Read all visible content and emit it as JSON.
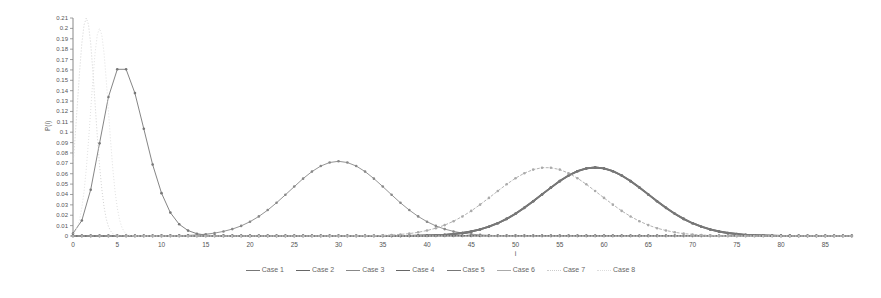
{
  "chart_data": {
    "type": "line",
    "title": "",
    "xlabel": "i",
    "ylabel": "P(i)",
    "xlim": [
      0,
      88
    ],
    "ylim": [
      0,
      0.21
    ],
    "x_ticks": [
      0,
      5,
      10,
      15,
      20,
      25,
      30,
      35,
      40,
      45,
      50,
      55,
      60,
      65,
      70,
      75,
      80,
      85
    ],
    "y_ticks": [
      0,
      0.01,
      0.02,
      0.03,
      0.04,
      0.05,
      0.06,
      0.07,
      0.08,
      0.09,
      0.1,
      0.11,
      0.12,
      0.13,
      0.14,
      0.15,
      0.16,
      0.17,
      0.18,
      0.19,
      0.2,
      0.21
    ],
    "y_tick_labels": [
      "0",
      "0.01",
      "0.02",
      "0.03",
      "0.04",
      "0.05",
      "0.06",
      "0.07",
      "0.08",
      "0.09",
      "0.1",
      "0.11",
      "0.12",
      "0.13",
      "0.14",
      "0.15",
      "0.16",
      "0.17",
      "0.18",
      "0.19",
      "0.2",
      "0.21"
    ],
    "grid": false,
    "legend_position": "bottom",
    "series": [
      {
        "name": "Case 1",
        "peak_x": 6,
        "peak_y": 0.145,
        "shape": "poisson",
        "lambda": 6,
        "color": "#777777",
        "marker": "x"
      },
      {
        "name": "Case 2",
        "peak_x": 0,
        "peak_y": 0.0,
        "shape": "flat",
        "color": "#666666",
        "marker": "diamond"
      },
      {
        "name": "Case 3",
        "peak_x": 30,
        "peak_y": 0.072,
        "shape": "gaussian",
        "sigma": 5.5,
        "color": "#888888",
        "marker": "dot"
      },
      {
        "name": "Case 4",
        "peak_x": 59,
        "peak_y": 0.066,
        "shape": "gaussian",
        "sigma": 6,
        "color": "#666666",
        "marker": "dot"
      },
      {
        "name": "Case 5",
        "peak_x": 59,
        "peak_y": 0.066,
        "shape": "gaussian",
        "sigma": 6,
        "color": "#777777",
        "marker": "dot"
      },
      {
        "name": "Case 6",
        "peak_x": 53.5,
        "peak_y": 0.066,
        "shape": "gaussian",
        "sigma": 6,
        "color": "#aaaaaa",
        "marker": "dash"
      },
      {
        "name": "Case 7",
        "peak_x": 1.5,
        "peak_y": 0.21,
        "shape": "spike",
        "sigma": 1.0,
        "color": "#cccccc",
        "marker": "dotted"
      },
      {
        "name": "Case 8",
        "peak_x": 3,
        "peak_y": 0.2,
        "shape": "spike",
        "sigma": 1.0,
        "color": "#dddddd",
        "marker": "dotted"
      }
    ]
  },
  "legend": {
    "items": [
      "Case 1",
      "Case 2",
      "Case 3",
      "Case 4",
      "Case 5",
      "Case 6",
      "Case 7",
      "Case 8"
    ]
  },
  "axes": {
    "xlabel": "i",
    "ylabel": "P(i)"
  }
}
